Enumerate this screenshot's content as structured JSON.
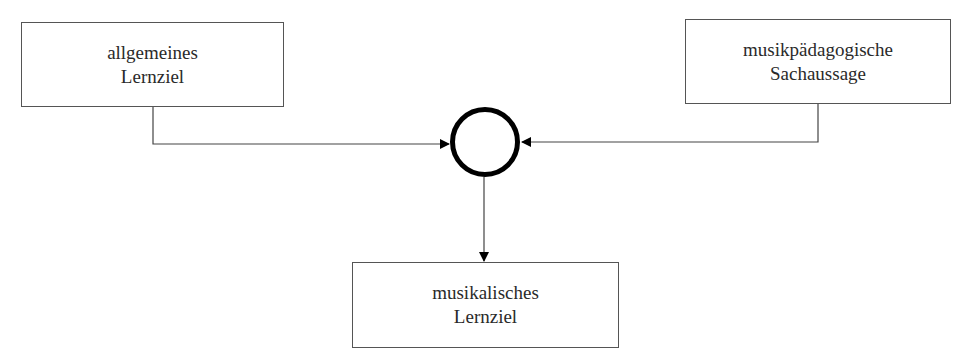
{
  "diagram": {
    "nodes": {
      "general_goal": {
        "line1": "allgemeines",
        "line2": "Lernziel"
      },
      "music_statement": {
        "line1": "musikpädagogische",
        "line2": "Sachaussage"
      },
      "music_goal": {
        "line1": "musikalisches",
        "line2": "Lernziel"
      }
    },
    "junction": "circle-junction",
    "edges": [
      {
        "from": "allgemeines Lernziel",
        "to": "junction"
      },
      {
        "from": "musikpädagogische Sachaussage",
        "to": "junction"
      },
      {
        "from": "junction",
        "to": "musikalisches Lernziel"
      }
    ]
  }
}
